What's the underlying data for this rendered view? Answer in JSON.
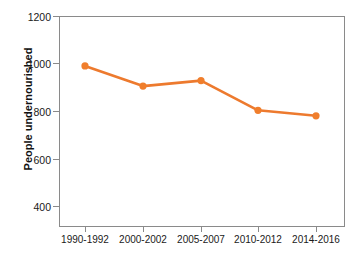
{
  "chart_data": {
    "type": "line",
    "title": "",
    "xlabel": "",
    "ylabel": "People undernourished",
    "categories": [
      "1990-1992",
      "2000-2002",
      "2005-2007",
      "2010-2012",
      "2014-2016"
    ],
    "values": [
      990,
      905,
      928,
      803,
      780
    ],
    "series": [
      {
        "name": "People undernourished",
        "values": [
          990,
          905,
          928,
          803,
          780
        ]
      }
    ],
    "ylim": [
      330,
      1200
    ],
    "yticks": [
      400,
      600,
      800,
      1000,
      1200
    ],
    "ytick_labels": [
      "400",
      "600",
      "800",
      "1000",
      "1200"
    ],
    "grid": false,
    "legend": false,
    "legend_position": "none",
    "line_color": "#ED7A2E",
    "marker_color": "#F07E2C",
    "marker_shape": "circle",
    "axis_color": "#8A8A8A",
    "text_color": "#1A1A1A",
    "background": "#FFFFFF"
  }
}
